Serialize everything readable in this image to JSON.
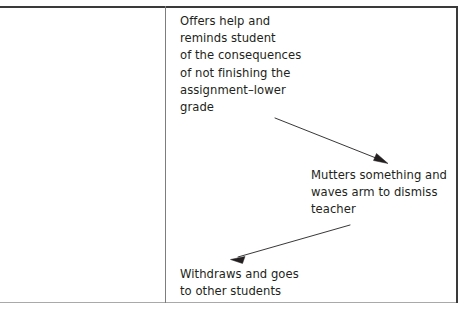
{
  "figure": {
    "type": "flow-diagram-table-cell",
    "layout": {
      "columns": 2,
      "left_column_empty": true
    },
    "colors": {
      "text": "#231f20",
      "rule_dark": "#3a3a3a",
      "rule_light": "#a9a9a9",
      "divider": "#7d7d7d",
      "arrow": "#231f20",
      "background": "#ffffff"
    }
  },
  "cells": {
    "left": {
      "content": ""
    },
    "right": {
      "blocks": [
        {
          "id": "offers-help",
          "text": "Offers help and\nreminds student\nof the consequences\nof not finishing the\nassignment–lower\ngrade"
        },
        {
          "id": "mutters",
          "text": "Mutters something and\nwaves arm to dismiss\nteacher"
        },
        {
          "id": "withdraws",
          "text": "Withdraws and goes\nto other students"
        }
      ],
      "arrows": [
        {
          "id": "arrow-down-right",
          "from_block": "offers-help",
          "to_block": "mutters",
          "direction": "down-right"
        },
        {
          "id": "arrow-down-left",
          "from_block": "mutters",
          "to_block": "withdraws",
          "direction": "down-left"
        }
      ]
    }
  }
}
